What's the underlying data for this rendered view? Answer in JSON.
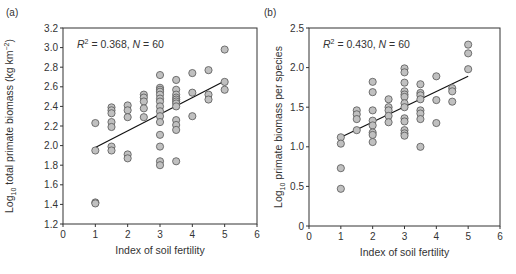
{
  "chart_data": [
    {
      "type": "scatter",
      "panel_label": "(a)",
      "annotation": {
        "r2": "0.368",
        "n": "60"
      },
      "xlabel": "Index of soil fertility",
      "ylabel": "Log10 total primate biomass (kg km-2)",
      "xlim": [
        0,
        6
      ],
      "ylim": [
        1.2,
        3.2
      ],
      "xticks": [
        0,
        1,
        2,
        3,
        4,
        5,
        6
      ],
      "yticks": [
        "1.2",
        "1.4",
        "1.6",
        "1.8",
        "2.0",
        "2.2",
        "2.4",
        "2.6",
        "2.8",
        "3.0",
        "3.2"
      ],
      "grid": false,
      "points": [
        [
          1,
          2.23
        ],
        [
          1,
          1.95
        ],
        [
          1,
          1.42
        ],
        [
          1,
          1.41
        ],
        [
          1.5,
          2.39
        ],
        [
          1.5,
          2.36
        ],
        [
          1.5,
          2.33
        ],
        [
          1.5,
          2.24
        ],
        [
          1.5,
          2.19
        ],
        [
          1.5,
          1.99
        ],
        [
          1.5,
          1.95
        ],
        [
          2,
          2.41
        ],
        [
          2,
          2.36
        ],
        [
          2,
          2.29
        ],
        [
          2,
          1.91
        ],
        [
          2,
          1.87
        ],
        [
          2.5,
          2.52
        ],
        [
          2.5,
          2.49
        ],
        [
          2.5,
          2.45
        ],
        [
          2.5,
          2.38
        ],
        [
          2.5,
          2.29
        ],
        [
          3,
          2.72
        ],
        [
          3,
          2.59
        ],
        [
          3,
          2.57
        ],
        [
          3,
          2.55
        ],
        [
          3,
          2.52
        ],
        [
          3,
          2.48
        ],
        [
          3,
          2.45
        ],
        [
          3,
          2.4
        ],
        [
          3,
          2.35
        ],
        [
          3,
          2.3
        ],
        [
          3,
          2.24
        ],
        [
          3,
          2.11
        ],
        [
          3,
          1.99
        ],
        [
          3,
          1.84
        ],
        [
          3,
          1.8
        ],
        [
          3.5,
          2.67
        ],
        [
          3.5,
          2.57
        ],
        [
          3.5,
          2.52
        ],
        [
          3.5,
          2.49
        ],
        [
          3.5,
          2.47
        ],
        [
          3.5,
          2.45
        ],
        [
          3.5,
          2.43
        ],
        [
          3.5,
          2.4
        ],
        [
          3.5,
          2.26
        ],
        [
          3.5,
          2.21
        ],
        [
          3.5,
          2.16
        ],
        [
          3.5,
          1.84
        ],
        [
          4,
          2.74
        ],
        [
          4,
          2.54
        ],
        [
          4,
          2.3
        ],
        [
          4.5,
          2.77
        ],
        [
          4.5,
          2.52
        ],
        [
          4.5,
          2.47
        ],
        [
          5,
          2.98
        ],
        [
          5,
          2.65
        ],
        [
          5,
          2.57
        ]
      ],
      "fit_line": [
        [
          1,
          1.98
        ],
        [
          5,
          2.66
        ]
      ],
      "frame": {
        "left": 63,
        "right": 257,
        "top": 28,
        "bottom": 224
      }
    },
    {
      "type": "scatter",
      "panel_label": "(b)",
      "annotation": {
        "r2": "0.430",
        "n": "60"
      },
      "xlabel": "Index of soil fertility",
      "ylabel": "Log10 primate biomass per species",
      "xlim": [
        0,
        6
      ],
      "ylim": [
        0,
        2.5
      ],
      "xticks": [
        0,
        1,
        2,
        3,
        4,
        5,
        6
      ],
      "yticks": [
        "0",
        "0.5",
        "1.0",
        "1.5",
        "2.0",
        "2.5"
      ],
      "grid": false,
      "points": [
        [
          1,
          1.12
        ],
        [
          1,
          1.04
        ],
        [
          1,
          0.73
        ],
        [
          1,
          0.47
        ],
        [
          1.5,
          1.46
        ],
        [
          1.5,
          1.41
        ],
        [
          1.5,
          1.35
        ],
        [
          1.5,
          1.21
        ],
        [
          2,
          1.82
        ],
        [
          2,
          1.69
        ],
        [
          2,
          1.46
        ],
        [
          2,
          1.33
        ],
        [
          2,
          1.27
        ],
        [
          2,
          1.18
        ],
        [
          2,
          1.15
        ],
        [
          2,
          1.06
        ],
        [
          2.5,
          1.6
        ],
        [
          2.5,
          1.5
        ],
        [
          2.5,
          1.46
        ],
        [
          2.5,
          1.39
        ],
        [
          2.5,
          1.31
        ],
        [
          3,
          1.99
        ],
        [
          3,
          1.94
        ],
        [
          3,
          1.81
        ],
        [
          3,
          1.7
        ],
        [
          3,
          1.66
        ],
        [
          3,
          1.63
        ],
        [
          3,
          1.55
        ],
        [
          3,
          1.5
        ],
        [
          3,
          1.36
        ],
        [
          3,
          1.32
        ],
        [
          3,
          1.21
        ],
        [
          3,
          1.17
        ],
        [
          3,
          1.14
        ],
        [
          3.5,
          1.79
        ],
        [
          3.5,
          1.68
        ],
        [
          3.5,
          1.65
        ],
        [
          3.5,
          1.6
        ],
        [
          3.5,
          1.46
        ],
        [
          3.5,
          1.42
        ],
        [
          3.5,
          1.35
        ],
        [
          3.5,
          1.0
        ],
        [
          4,
          1.89
        ],
        [
          4,
          1.59
        ],
        [
          4,
          1.3
        ],
        [
          4.5,
          1.74
        ],
        [
          4.5,
          1.7
        ],
        [
          4.5,
          1.57
        ],
        [
          5,
          2.29
        ],
        [
          5,
          2.18
        ],
        [
          5,
          1.98
        ]
      ],
      "fit_line": [
        [
          1,
          1.12
        ],
        [
          5,
          1.89
        ]
      ],
      "frame": {
        "left": 309,
        "right": 500,
        "top": 28,
        "bottom": 226
      }
    }
  ],
  "style": {
    "point_fill": "#c0c0c0",
    "point_stroke": "#555555",
    "axis_color": "#333333",
    "line_color": "#111111"
  }
}
